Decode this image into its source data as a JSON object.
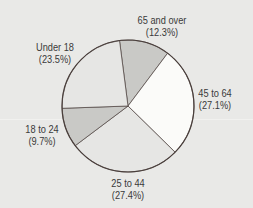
{
  "chart_data": {
    "type": "pie",
    "title": "",
    "start_angle_deg": -97.4,
    "direction": "clockwise",
    "center": [
      128,
      106
    ],
    "radius": 66,
    "slices": [
      {
        "label": "65 and over",
        "value": 12.3,
        "display": "(12.3%)",
        "color": "#c9c9c6",
        "label_pos": [
          162,
          14
        ]
      },
      {
        "label": "45 to 64",
        "value": 27.1,
        "display": "(27.1%)",
        "color": "#fbfbf9",
        "label_pos": [
          215,
          87
        ]
      },
      {
        "label": "25 to 44",
        "value": 27.4,
        "display": "(27.4%)",
        "color": "#e6e6e4",
        "label_pos": [
          128,
          177
        ]
      },
      {
        "label": "18 to 24",
        "value": 9.7,
        "display": "(9.7%)",
        "color": "#c9c9c6",
        "label_pos": [
          42,
          123
        ]
      },
      {
        "label": "Under 18",
        "value": 23.5,
        "display": "(23.5%)",
        "color": "#e6e6e4",
        "label_pos": [
          55,
          41
        ]
      }
    ],
    "outline_color": "#4a3f3c",
    "legend": "none"
  }
}
